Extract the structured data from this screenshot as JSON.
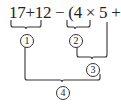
{
  "expression": "17+12 − (4 × 5 + 6)",
  "steps": [
    {
      "label": "1",
      "covers": "17+12"
    },
    {
      "label": "2",
      "covers": "4 × 5"
    },
    {
      "label": "3",
      "covers": "4 × 5 + 6"
    },
    {
      "label": "4",
      "covers": "17+12 − (4 × 5 + 6)"
    }
  ]
}
